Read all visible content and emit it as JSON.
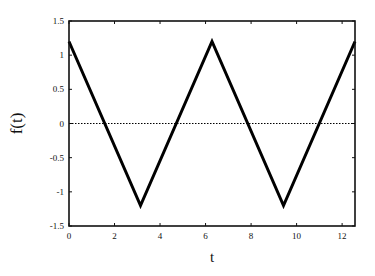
{
  "chart_data": {
    "type": "line",
    "title": "",
    "xlabel": "t",
    "ylabel": "f(t)",
    "xlim": [
      0,
      12.566
    ],
    "ylim": [
      -1.5,
      1.5
    ],
    "grid": false,
    "legend": null,
    "xticks": [
      "0",
      "2",
      "4",
      "6",
      "8",
      "10",
      "12"
    ],
    "yticks": [
      "1.5",
      "1",
      "0.5",
      "0",
      "-0.5",
      "-1",
      "-1.5"
    ],
    "series": [
      {
        "name": "f(t)",
        "style": "solid",
        "color": "#000000",
        "x": [
          0,
          3.1416,
          6.2832,
          9.4248,
          12.566
        ],
        "y": [
          1.2,
          -1.2,
          1.2,
          -1.2,
          1.2
        ]
      },
      {
        "name": "zero line",
        "style": "dotted",
        "color": "#000000",
        "x": [
          0,
          12.566
        ],
        "y": [
          0,
          0
        ]
      }
    ]
  }
}
